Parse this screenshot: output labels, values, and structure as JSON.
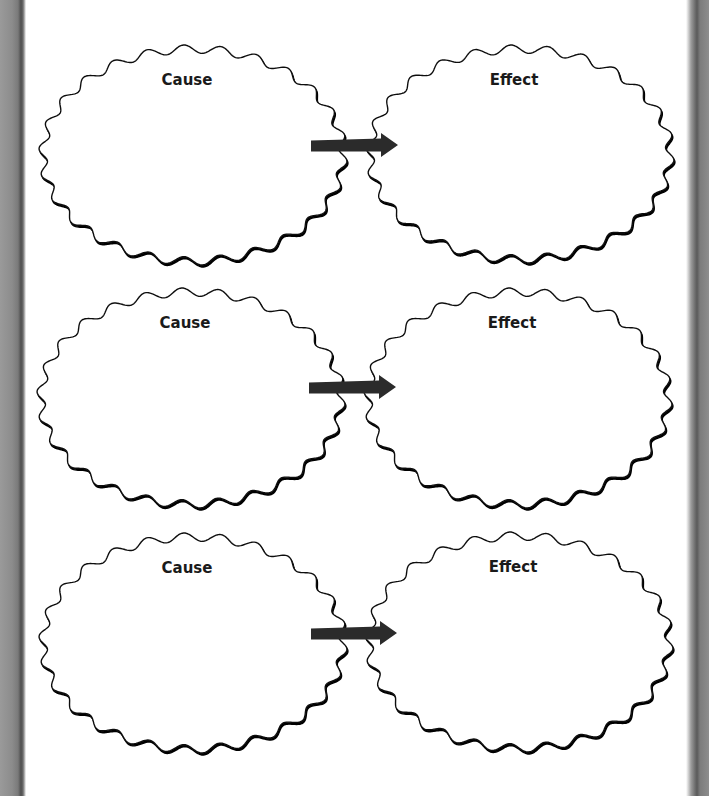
{
  "worksheet": {
    "title_partial": "",
    "rows": [
      {
        "cause": {
          "label": "Cause",
          "cx": 193,
          "cy": 155,
          "rx": 150,
          "ry": 106
        },
        "effect": {
          "label": "Effect",
          "cx": 520,
          "cy": 154,
          "rx": 150,
          "ry": 105
        },
        "arrow": {
          "x1": 311,
          "x2": 398,
          "y": 145
        }
      },
      {
        "cause": {
          "label": "Cause",
          "cx": 191,
          "cy": 398,
          "rx": 150,
          "ry": 106
        },
        "effect": {
          "label": "Effect",
          "cx": 518,
          "cy": 398,
          "rx": 150,
          "ry": 106
        },
        "arrow": {
          "x1": 309,
          "x2": 396,
          "y": 387
        }
      },
      {
        "cause": {
          "label": "Cause",
          "cx": 193,
          "cy": 643,
          "rx": 150,
          "ry": 106
        },
        "effect": {
          "label": "Effect",
          "cx": 519,
          "cy": 642,
          "rx": 150,
          "ry": 106
        },
        "arrow": {
          "x1": 311,
          "x2": 397,
          "y": 633
        }
      }
    ]
  },
  "colors": {
    "stroke": "#111111",
    "arrow": "#2b2b2b",
    "frame": "#8a8a8a"
  },
  "icons": {
    "arrow": "right-arrow-icon"
  }
}
